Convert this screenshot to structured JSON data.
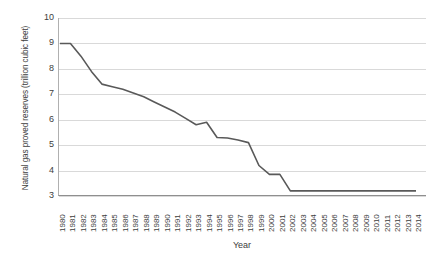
{
  "chart_data": {
    "type": "line",
    "title": "",
    "xlabel": "Year",
    "ylabel": "Natural gas proved reserves (trillion cubic feet)",
    "ylim": [
      3,
      10
    ],
    "yticks": [
      3,
      4,
      5,
      6,
      7,
      8,
      9,
      10
    ],
    "grid": true,
    "legend": "none",
    "line_color": "#595959",
    "categories": [
      "1980",
      "1981",
      "1982",
      "1983",
      "1984",
      "1985",
      "1986",
      "1987",
      "1988",
      "1989",
      "1990",
      "1991",
      "1992",
      "1993",
      "1994",
      "1995",
      "1996",
      "1997",
      "1998",
      "1999",
      "2000",
      "2001",
      "2002",
      "2003",
      "2004",
      "2005",
      "2006",
      "2007",
      "2008",
      "2009",
      "2010",
      "2011",
      "2012",
      "2013",
      "2014"
    ],
    "values": [
      9.0,
      9.0,
      8.5,
      7.9,
      7.4,
      7.3,
      7.2,
      7.05,
      6.9,
      6.7,
      6.5,
      6.3,
      6.05,
      5.8,
      5.9,
      5.3,
      5.28,
      5.2,
      5.1,
      4.2,
      3.85,
      3.85,
      3.2,
      3.2,
      3.2,
      3.2,
      3.2,
      3.2,
      3.2,
      3.2,
      3.2,
      3.2,
      3.2,
      3.2,
      3.2
    ]
  }
}
